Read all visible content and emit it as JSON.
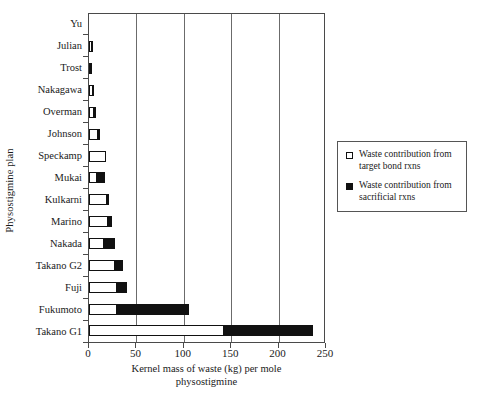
{
  "chart_data": {
    "type": "bar",
    "orientation": "horizontal",
    "stacked": true,
    "title": "",
    "xlabel": "Kernel mass of waste (kg) per mole physostigmine",
    "ylabel": "Physostigmine plan",
    "xlim": [
      0,
      250
    ],
    "xticks": [
      0,
      50,
      100,
      150,
      200,
      250
    ],
    "xtick_labels": [
      "0",
      "50",
      "100",
      "150",
      "200",
      "250"
    ],
    "grid": "vertical",
    "legend_position": "right",
    "categories": [
      "Yu",
      "Julian",
      "Trost",
      "Nakagawa",
      "Overman",
      "Johnson",
      "Speckamp",
      "Mukai",
      "Kulkarni",
      "Marino",
      "Nakada",
      "Takano G2",
      "Fuji",
      "Fukumoto",
      "Takano G1"
    ],
    "series": [
      {
        "name": "Waste contribution from target bond rxns",
        "color": "#ffffff",
        "values": [
          0,
          3,
          2,
          4,
          5,
          9,
          18,
          8,
          19,
          20,
          16,
          27,
          30,
          30,
          142
        ]
      },
      {
        "name": "Waste contribution from sacrificial rxns",
        "color": "#111111",
        "values": [
          0,
          1,
          2,
          1,
          3,
          4,
          0,
          10,
          3,
          5,
          13,
          10,
          11,
          77,
          95
        ]
      }
    ],
    "totals": [
      0,
      4,
      4,
      5,
      8,
      13,
      18,
      18,
      22,
      25,
      29,
      37,
      41,
      107,
      237
    ]
  },
  "axis": {
    "y_title": "Physostigmine plan",
    "x_title_line1": "Kernel mass of waste (kg) per mole",
    "x_title_line2": "physostigmine"
  },
  "legend": {
    "items": [
      {
        "swatch": "hollow-square-icon",
        "label_line1": "Waste contribution from",
        "label_line2": "target bond rxns"
      },
      {
        "swatch": "filled-square-icon",
        "label_line1": "Waste contribution from",
        "label_line2": "sacrificial rxns"
      }
    ]
  }
}
